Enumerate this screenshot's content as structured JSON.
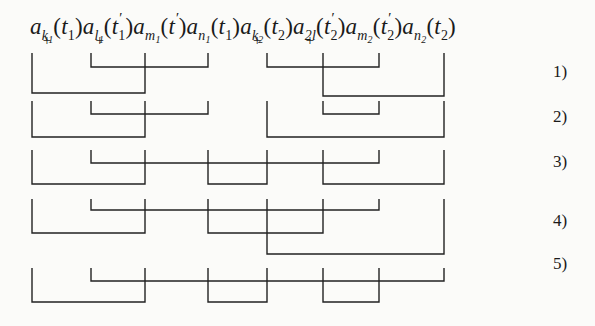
{
  "formula": {
    "operators": [
      {
        "base": "a",
        "sub": "k",
        "subsub": "1",
        "sup": "+",
        "arg": "t",
        "argsub": "1",
        "prime": ""
      },
      {
        "base": "a",
        "sub": "l",
        "subsub": "1",
        "sup": "+",
        "arg": "t",
        "argsub": "1",
        "prime": "′"
      },
      {
        "base": "a",
        "sub": "m",
        "subsub": "1",
        "sup": "",
        "arg": "t",
        "argsub": "",
        "prime": "′"
      },
      {
        "base": "a",
        "sub": "n",
        "subsub": "1",
        "sup": "",
        "arg": "t",
        "argsub": "1",
        "prime": ""
      },
      {
        "base": "a",
        "sub": "k",
        "subsub": "2",
        "sup": "+",
        "arg": "t",
        "argsub": "2",
        "prime": ""
      },
      {
        "base": "a",
        "sub": "2l",
        "subsub": "",
        "sup": "+",
        "arg": "t",
        "argsub": "2",
        "prime": "′"
      },
      {
        "base": "a",
        "sub": "m",
        "subsub": "2",
        "sup": "",
        "arg": "t",
        "argsub": "2",
        "prime": "′"
      },
      {
        "base": "a",
        "sub": "n",
        "subsub": "2",
        "sup": "",
        "arg": "t",
        "argsub": "2",
        "prime": ""
      }
    ],
    "text": "a+k1(t1) a+l1(t'1) am1(t') an1(t1) a+k2(t2) a+2l(t'2) am2(t'2) an2(t2)"
  },
  "columns_x": [
    32,
    91,
    145,
    208,
    267,
    323,
    379,
    444
  ],
  "line_color": "#222222",
  "diagrams": [
    {
      "label": "1)",
      "label_y": 62,
      "top": 53,
      "pairs": [
        {
          "a": 0,
          "b": 2,
          "y": 93
        },
        {
          "a": 1,
          "b": 3,
          "y": 67
        },
        {
          "a": 4,
          "b": 6,
          "y": 67
        },
        {
          "a": 5,
          "b": 7,
          "y": 96
        }
      ]
    },
    {
      "label": "2)",
      "label_y": 107,
      "top": 101,
      "pairs": [
        {
          "a": 0,
          "b": 2,
          "y": 137
        },
        {
          "a": 1,
          "b": 3,
          "y": 114
        },
        {
          "a": 4,
          "b": 7,
          "y": 137
        },
        {
          "a": 5,
          "b": 6,
          "y": 114
        }
      ]
    },
    {
      "label": "3)",
      "label_y": 152,
      "top": 150,
      "pairs": [
        {
          "a": 0,
          "b": 2,
          "y": 184
        },
        {
          "a": 1,
          "b": 6,
          "y": 163
        },
        {
          "a": 3,
          "b": 4,
          "y": 184
        },
        {
          "a": 5,
          "b": 7,
          "y": 184
        }
      ]
    },
    {
      "label": "4)",
      "label_y": 211,
      "top": 199,
      "pairs": [
        {
          "a": 0,
          "b": 2,
          "y": 233
        },
        {
          "a": 1,
          "b": 6,
          "y": 210
        },
        {
          "a": 3,
          "b": 5,
          "y": 233
        },
        {
          "a": 4,
          "b": 7,
          "y": 254
        }
      ]
    },
    {
      "label": "5)",
      "label_y": 254,
      "top": 268,
      "pairs": [
        {
          "a": 0,
          "b": 2,
          "y": 302
        },
        {
          "a": 1,
          "b": 7,
          "y": 281
        },
        {
          "a": 3,
          "b": 4,
          "y": 302
        },
        {
          "a": 5,
          "b": 6,
          "y": 302
        }
      ]
    }
  ]
}
